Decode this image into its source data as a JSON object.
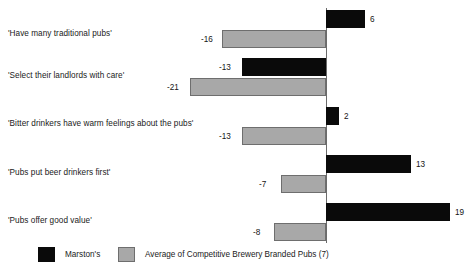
{
  "chart_data": {
    "type": "bar",
    "orientation": "horizontal",
    "title": "",
    "subtitle": "",
    "xlabel": "",
    "ylabel": "",
    "grid": false,
    "legend_position": "bottom-left",
    "zero_line": true,
    "xlim": [
      -21,
      19
    ],
    "categories": [
      "'Have many traditional pubs'",
      "'Select their landlords with care'",
      "'Bitter drinkers have warm feelings about the pubs'",
      "'Pubs put beer drinkers first'",
      "'Pubs offer good value'"
    ],
    "series": [
      {
        "name": "Marston's",
        "color": "#0a0a0a",
        "values": [
          6,
          -13,
          2,
          13,
          19
        ]
      },
      {
        "name": "Average of Competitive Brewery Branded Pubs (7)",
        "color": "#a8a8a8",
        "values": [
          -16,
          -21,
          -13,
          -7,
          -8
        ]
      }
    ],
    "data_labels": {
      "marstons": [
        "6",
        "-13",
        "2",
        "13",
        "19"
      ],
      "average": [
        "-16",
        "-21",
        "-13",
        "-7",
        "-8"
      ]
    }
  },
  "legend": {
    "items": [
      {
        "label": "Marston's",
        "color": "#0a0a0a"
      },
      {
        "label": "Average of Competitive Brewery Branded Pubs (7)",
        "color": "#a8a8a8"
      }
    ]
  }
}
